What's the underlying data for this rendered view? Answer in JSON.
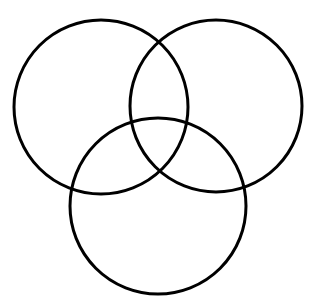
{
  "diagram": {
    "type": "venn",
    "background": "#ffffff",
    "stroke_color": "#000000",
    "stroke_width": 3,
    "circles": [
      {
        "id": "top-left",
        "cx": 101,
        "cy": 107,
        "r": 87
      },
      {
        "id": "top-right",
        "cx": 216,
        "cy": 106,
        "r": 86
      },
      {
        "id": "bottom",
        "cx": 158,
        "cy": 206,
        "r": 88
      }
    ]
  }
}
